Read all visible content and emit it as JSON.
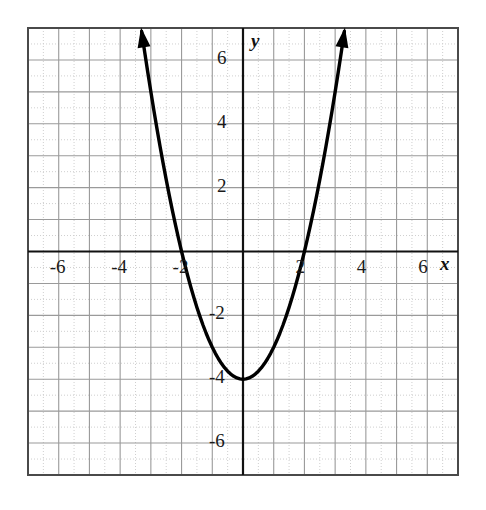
{
  "chart_data": {
    "type": "line",
    "title": "",
    "xlabel": "x",
    "ylabel": "y",
    "equation": "y = x^2 - 4",
    "curve_label": "parabola",
    "xlim": [
      -7,
      7
    ],
    "ylim": [
      -7,
      7
    ],
    "grid": true,
    "grid_major_step": 1,
    "grid_minor_step": 0.5,
    "legend": "none",
    "x_tick_labels": [
      "-6",
      "-4",
      "-2",
      "2",
      "4",
      "6"
    ],
    "x_tick_values": [
      -6,
      -4,
      -2,
      2,
      4,
      6
    ],
    "y_tick_labels": [
      "6",
      "4",
      "2",
      "-2",
      "-4",
      "-6"
    ],
    "y_tick_values": [
      6,
      4,
      2,
      -2,
      -4,
      -6
    ],
    "vertex": [
      0,
      -4
    ],
    "x_intercepts": [
      -2,
      2
    ],
    "y_intercept": -4,
    "arrowheads": [
      "upper-left",
      "upper-right"
    ],
    "x": [
      -3.3,
      -3.2,
      -3.1,
      -3.0,
      -2.9,
      -2.8,
      -2.7,
      -2.6,
      -2.5,
      -2.4,
      -2.3,
      -2.2,
      -2.1,
      -2.0,
      -1.9,
      -1.8,
      -1.7,
      -1.6,
      -1.5,
      -1.4,
      -1.3,
      -1.2,
      -1.1,
      -1.0,
      -0.9,
      -0.8,
      -0.7,
      -0.6,
      -0.5,
      -0.4,
      -0.3,
      -0.2,
      -0.1,
      0.0,
      0.1,
      0.2,
      0.3,
      0.4,
      0.5,
      0.6,
      0.7,
      0.8,
      0.9,
      1.0,
      1.1,
      1.2,
      1.3,
      1.4,
      1.5,
      1.6,
      1.7,
      1.8,
      1.9,
      2.0,
      2.1,
      2.2,
      2.3,
      2.4,
      2.5,
      2.6,
      2.7,
      2.8,
      2.9,
      3.0,
      3.1,
      3.2,
      3.3
    ],
    "y": [
      6.89,
      6.24,
      5.61,
      5.0,
      4.41,
      3.84,
      3.29,
      2.76,
      2.25,
      1.76,
      1.29,
      0.84,
      0.41,
      0.0,
      -0.39,
      -0.76,
      -1.11,
      -1.44,
      -1.75,
      -2.04,
      -2.31,
      -2.56,
      -2.79,
      -3.0,
      -3.19,
      -3.36,
      -3.51,
      -3.64,
      -3.75,
      -3.84,
      -3.91,
      -3.96,
      -3.99,
      -4.0,
      -3.99,
      -3.96,
      -3.91,
      -3.84,
      -3.75,
      -3.64,
      -3.51,
      -3.36,
      -3.19,
      -3.0,
      -2.79,
      -2.56,
      -2.31,
      -2.04,
      -1.75,
      -1.44,
      -1.11,
      -0.76,
      -0.39,
      0.0,
      0.41,
      0.84,
      1.29,
      1.76,
      2.25,
      2.76,
      3.29,
      3.84,
      4.41,
      5.0,
      5.61,
      6.24,
      6.89
    ]
  },
  "colors": {
    "curve": "#000000",
    "axis": "#111111",
    "grid_major": "#9a9a9a",
    "grid_minor": "#cfcfcf",
    "border": "#4a4a4a",
    "background": "#ffffff",
    "tick_text": "#1a1a1a"
  }
}
